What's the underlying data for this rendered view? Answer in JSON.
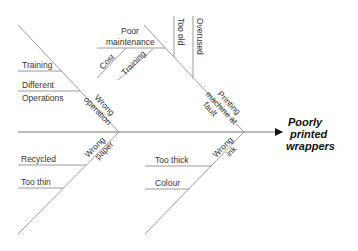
{
  "diagram": {
    "type": "fishbone",
    "effect": {
      "lines": [
        "Poorly",
        "printed",
        "wrappers"
      ]
    },
    "causes": [
      {
        "category": [
          "Wrong",
          "operation"
        ],
        "position": "upper-left",
        "sub_causes": [
          {
            "label": [
              "Training"
            ]
          },
          {
            "label": [
              "Different",
              "Operations"
            ]
          }
        ]
      },
      {
        "category": [
          "Printing",
          "machine at",
          "fault"
        ],
        "position": "upper-right",
        "sub_causes": [
          {
            "label": [
              "Poor",
              "maintenance"
            ]
          },
          {
            "label": [
              "Cost"
            ]
          },
          {
            "label": [
              "Training"
            ]
          },
          {
            "label": [
              "Too old"
            ]
          },
          {
            "label": [
              "Overused"
            ]
          }
        ]
      },
      {
        "category": [
          "Wrong",
          "paper"
        ],
        "position": "lower-left",
        "sub_causes": [
          {
            "label": [
              "Recycled"
            ]
          },
          {
            "label": [
              "Too thin"
            ]
          }
        ]
      },
      {
        "category": [
          "Wrong",
          "ink"
        ],
        "position": "lower-right",
        "sub_causes": [
          {
            "label": [
              "Too thick"
            ]
          },
          {
            "label": [
              "Colour"
            ]
          }
        ]
      }
    ],
    "colors": {
      "line": "#9a9a9a",
      "text": "#333333",
      "effect_text": "#111111",
      "background": "#ffffff"
    }
  }
}
